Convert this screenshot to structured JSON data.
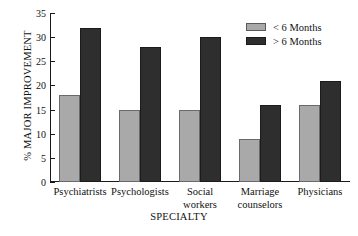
{
  "chart_data": {
    "type": "bar",
    "title": "",
    "xlabel": "SPECIALTY",
    "ylabel": "% MAJOR IMPROVEMENT",
    "ylim": [
      0,
      35
    ],
    "yticks": [
      0,
      5,
      10,
      15,
      20,
      25,
      30,
      35
    ],
    "grid": false,
    "legend_position": "top-right",
    "categories": [
      "Psychiatrists",
      "Psychologists",
      "Social\nworkers",
      "Marriage\ncounselors",
      "Physicians"
    ],
    "series": [
      {
        "name": "< 6 Months",
        "color": "#a9a9a9",
        "values": [
          18,
          15,
          15,
          9,
          16
        ]
      },
      {
        "name": "> 6 Months",
        "color": "#2e2e2e",
        "values": [
          32,
          28,
          30,
          16,
          21
        ]
      }
    ]
  },
  "axis": {
    "tick_labels": [
      "0",
      "5",
      "10",
      "15",
      "20",
      "25",
      "30",
      "35"
    ],
    "y_title": "% MAJOR IMPROVEMENT",
    "x_title": "SPECIALTY"
  },
  "categories": [
    {
      "line1": "Psychiatrists",
      "line2": ""
    },
    {
      "line1": "Psychologists",
      "line2": ""
    },
    {
      "line1": "Social",
      "line2": "workers"
    },
    {
      "line1": "Marriage",
      "line2": "counselors"
    },
    {
      "line1": "Physicians",
      "line2": ""
    }
  ],
  "legend": {
    "items": [
      {
        "label": "< 6 Months",
        "swatch": "light-gray-swatch"
      },
      {
        "label": "> 6 Months",
        "swatch": "dark-gray-swatch"
      }
    ]
  }
}
